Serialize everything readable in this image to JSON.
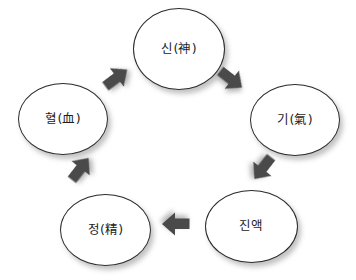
{
  "diagram": {
    "title": "",
    "background_color": "#ffffff",
    "node_fill": "#ffffff",
    "node_stroke": "#2b2b2b",
    "arrow_color": "#4a4a4a",
    "nodes": [
      {
        "id": "shin",
        "label": "신(神)",
        "position": "top"
      },
      {
        "id": "gi",
        "label": "기(氣)",
        "position": "right"
      },
      {
        "id": "jinaek",
        "label": "진액",
        "position": "bottom-right"
      },
      {
        "id": "jeong",
        "label": "정(精)",
        "position": "bottom-left"
      },
      {
        "id": "hyeol",
        "label": "혈(血)",
        "position": "left"
      }
    ],
    "arrows": [
      {
        "id": "shin-to-gi",
        "from": "shin",
        "to": "gi",
        "direction": "down-right"
      },
      {
        "id": "gi-to-jinaek",
        "from": "gi",
        "to": "jinaek",
        "direction": "down-left"
      },
      {
        "id": "jinaek-to-jeong",
        "from": "jinaek",
        "to": "jeong",
        "direction": "left"
      },
      {
        "id": "jeong-to-hyeol",
        "from": "jeong",
        "to": "hyeol",
        "direction": "up-left"
      },
      {
        "id": "hyeol-to-shin",
        "from": "hyeol",
        "to": "shin",
        "direction": "up-right"
      }
    ]
  }
}
